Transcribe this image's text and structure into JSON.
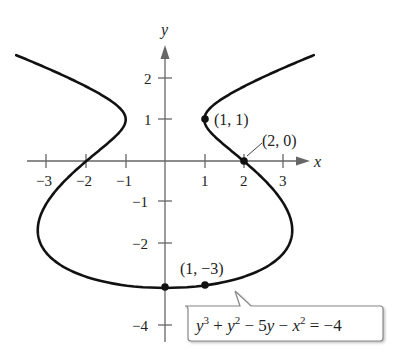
{
  "figure": {
    "equation": {
      "parts": [
        "y",
        "3",
        " + ",
        "y",
        "2",
        " − 5",
        "y",
        " − ",
        "x",
        "2",
        " = −4"
      ],
      "plain": "y^3 + y^2 - 5y - x^2 = -4"
    },
    "axes": {
      "x_label": "x",
      "y_label": "y",
      "x_ticks": [
        "−3",
        "−2",
        "−1",
        "1",
        "2",
        "3"
      ],
      "y_ticks": [
        "2",
        "1",
        "−1",
        "−2",
        "−4"
      ]
    },
    "points": [
      {
        "label": "(1, 1)",
        "x": 1,
        "y": 1
      },
      {
        "label": "(2, 0)",
        "x": 2,
        "y": 0
      },
      {
        "label": "(1, −3)",
        "x": 1,
        "y": -3
      },
      {
        "label": "",
        "x": 0,
        "y": -3
      }
    ],
    "colors": {
      "curve": "#111111",
      "axis": "#666666",
      "callout_border": "#888888"
    }
  }
}
